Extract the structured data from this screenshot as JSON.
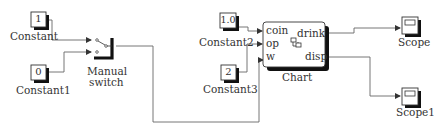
{
  "diagram": {
    "type": "simulink-model",
    "blocks": {
      "constant": {
        "label": "Constant",
        "value": "1"
      },
      "constant1": {
        "label": "Constant1",
        "value": "0"
      },
      "constant2": {
        "label": "Constant2",
        "value": "1.0"
      },
      "constant3": {
        "label": "Constant3",
        "value": "2"
      },
      "manual_switch": {
        "label_line1": "Manual",
        "label_line2": "switch"
      },
      "chart": {
        "label": "Chart",
        "inputs": [
          "coin",
          "op",
          "w"
        ],
        "outputs": [
          "drink",
          "disp"
        ],
        "icon": "stateflow-icon"
      },
      "scope": {
        "label": "Scope"
      },
      "scope1": {
        "label": "Scope1"
      }
    },
    "connections": [
      {
        "from": "Constant",
        "to": "Manual switch (in 1)"
      },
      {
        "from": "Constant1",
        "to": "Manual switch (in 2)"
      },
      {
        "from": "Manual switch",
        "to": "Chart.w"
      },
      {
        "from": "Constant2",
        "to": "Chart.coin"
      },
      {
        "from": "Constant3",
        "to": "Chart.op"
      },
      {
        "from": "Chart.drink",
        "to": "Scope"
      },
      {
        "from": "Chart.disp",
        "to": "Scope1"
      }
    ],
    "colors": {
      "wire": "#555555",
      "block_border": "#333333",
      "shadow": "#111111",
      "background": "#ffffff"
    }
  }
}
